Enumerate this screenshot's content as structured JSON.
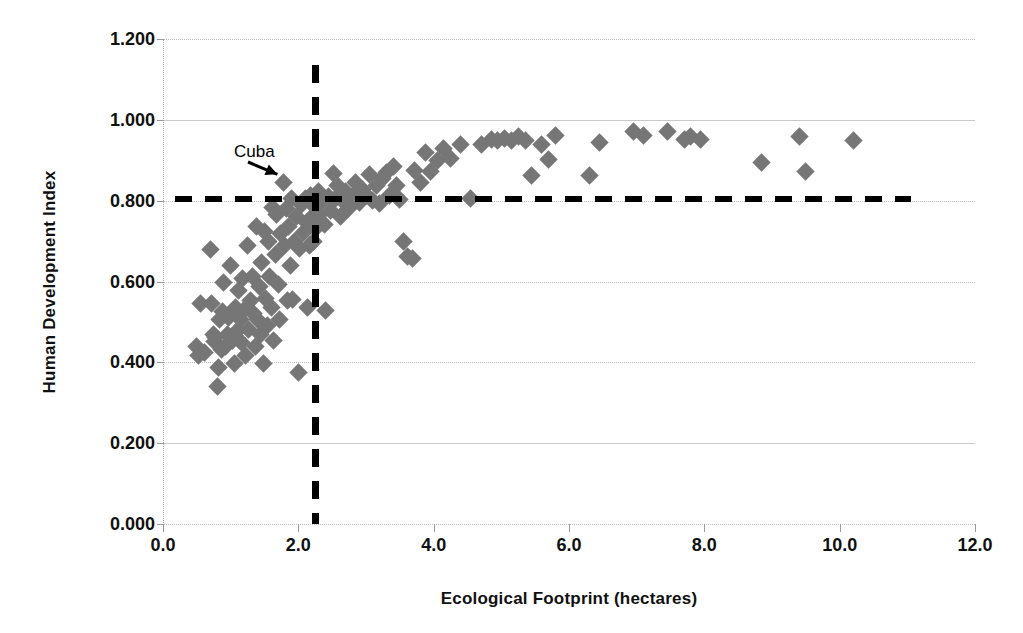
{
  "chart_data": {
    "type": "scatter",
    "title": "",
    "xlabel": "Ecological Footprint (hectares)",
    "ylabel": "Human Development Index",
    "xlim": [
      0.0,
      12.0
    ],
    "ylim": [
      0.0,
      1.2
    ],
    "xticks": [
      "0.0",
      "2.0",
      "4.0",
      "6.0",
      "8.0",
      "10.0",
      "12.0"
    ],
    "xtick_values": [
      0.0,
      2.0,
      4.0,
      6.0,
      8.0,
      10.0,
      12.0
    ],
    "yticks": [
      "0.000",
      "0.200",
      "0.400",
      "0.600",
      "0.800",
      "1.000",
      "1.200"
    ],
    "ytick_values": [
      0.0,
      0.2,
      0.4,
      0.6,
      0.8,
      1.0,
      1.2
    ],
    "grid": true,
    "legend": "none",
    "marker": "diamond",
    "marker_color": "#767676",
    "annotations": [
      {
        "text": "Cuba",
        "label_x": 1.05,
        "label_y": 0.92,
        "target_x": 1.78,
        "target_y": 0.845
      }
    ],
    "threshold_lines": [
      {
        "name": "hdi-threshold",
        "orientation": "horizontal",
        "value": 0.805,
        "x_start": 0.17,
        "x_end": 11.05,
        "color": "#000000",
        "style": "dashed"
      },
      {
        "name": "footprint-threshold",
        "orientation": "vertical",
        "value": 2.26,
        "y_start": 0.0,
        "y_end": 1.135,
        "color": "#000000",
        "style": "dashed"
      }
    ],
    "points": [
      [
        0.49,
        0.438
      ],
      [
        0.52,
        0.418
      ],
      [
        0.55,
        0.545
      ],
      [
        0.62,
        0.425
      ],
      [
        0.7,
        0.678
      ],
      [
        0.72,
        0.545
      ],
      [
        0.74,
        0.47
      ],
      [
        0.76,
        0.452
      ],
      [
        0.78,
        0.462
      ],
      [
        0.8,
        0.34
      ],
      [
        0.82,
        0.388
      ],
      [
        0.84,
        0.505
      ],
      [
        0.86,
        0.432
      ],
      [
        0.88,
        0.525
      ],
      [
        0.9,
        0.598
      ],
      [
        0.93,
        0.44
      ],
      [
        0.95,
        0.468
      ],
      [
        0.97,
        0.512
      ],
      [
        1.0,
        0.64
      ],
      [
        1.02,
        0.455
      ],
      [
        1.05,
        0.398
      ],
      [
        1.07,
        0.535
      ],
      [
        1.1,
        0.478
      ],
      [
        1.12,
        0.578
      ],
      [
        1.14,
        0.505
      ],
      [
        1.16,
        0.448
      ],
      [
        1.18,
        0.608
      ],
      [
        1.2,
        0.53
      ],
      [
        1.22,
        0.418
      ],
      [
        1.25,
        0.69
      ],
      [
        1.27,
        0.482
      ],
      [
        1.3,
        0.552
      ],
      [
        1.32,
        0.612
      ],
      [
        1.34,
        0.52
      ],
      [
        1.36,
        0.438
      ],
      [
        1.38,
        0.735
      ],
      [
        1.4,
        0.505
      ],
      [
        1.42,
        0.588
      ],
      [
        1.44,
        0.47
      ],
      [
        1.46,
        0.648
      ],
      [
        1.48,
        0.398
      ],
      [
        1.5,
        0.723
      ],
      [
        1.52,
        0.558
      ],
      [
        1.54,
        0.492
      ],
      [
        1.56,
        0.7
      ],
      [
        1.58,
        0.612
      ],
      [
        1.6,
        0.535
      ],
      [
        1.62,
        0.782
      ],
      [
        1.64,
        0.455
      ],
      [
        1.66,
        0.668
      ],
      [
        1.68,
        0.765
      ],
      [
        1.7,
        0.592
      ],
      [
        1.72,
        0.505
      ],
      [
        1.74,
        0.718
      ],
      [
        1.78,
        0.845
      ],
      [
        1.8,
        0.69
      ],
      [
        1.82,
        0.78
      ],
      [
        1.84,
        0.552
      ],
      [
        1.86,
        0.735
      ],
      [
        1.88,
        0.64
      ],
      [
        1.9,
        0.805
      ],
      [
        1.92,
        0.555
      ],
      [
        1.95,
        0.7
      ],
      [
        1.98,
        0.76
      ],
      [
        2.0,
        0.375
      ],
      [
        2.02,
        0.682
      ],
      [
        2.05,
        0.79
      ],
      [
        2.08,
        0.722
      ],
      [
        2.1,
        0.805
      ],
      [
        2.12,
        0.745
      ],
      [
        2.14,
        0.535
      ],
      [
        2.16,
        0.69
      ],
      [
        2.18,
        0.812
      ],
      [
        2.2,
        0.758
      ],
      [
        2.22,
        0.7
      ],
      [
        2.24,
        0.785
      ],
      [
        2.26,
        0.73
      ],
      [
        2.3,
        0.822
      ],
      [
        2.32,
        0.765
      ],
      [
        2.35,
        0.8
      ],
      [
        2.38,
        0.742
      ],
      [
        2.4,
        0.528
      ],
      [
        2.45,
        0.81
      ],
      [
        2.48,
        0.775
      ],
      [
        2.52,
        0.868
      ],
      [
        2.55,
        0.805
      ],
      [
        2.58,
        0.838
      ],
      [
        2.62,
        0.762
      ],
      [
        2.66,
        0.8
      ],
      [
        2.7,
        0.822
      ],
      [
        2.74,
        0.78
      ],
      [
        2.8,
        0.81
      ],
      [
        2.85,
        0.845
      ],
      [
        2.9,
        0.795
      ],
      [
        2.95,
        0.828
      ],
      [
        3.0,
        0.812
      ],
      [
        3.05,
        0.865
      ],
      [
        3.1,
        0.8
      ],
      [
        3.15,
        0.838
      ],
      [
        3.2,
        0.792
      ],
      [
        3.25,
        0.855
      ],
      [
        3.3,
        0.87
      ],
      [
        3.35,
        0.812
      ],
      [
        3.4,
        0.885
      ],
      [
        3.45,
        0.838
      ],
      [
        3.5,
        0.802
      ],
      [
        3.55,
        0.7
      ],
      [
        3.62,
        0.662
      ],
      [
        3.68,
        0.658
      ],
      [
        3.72,
        0.875
      ],
      [
        3.8,
        0.845
      ],
      [
        3.88,
        0.92
      ],
      [
        3.95,
        0.872
      ],
      [
        4.05,
        0.9
      ],
      [
        4.15,
        0.93
      ],
      [
        4.25,
        0.905
      ],
      [
        4.4,
        0.94
      ],
      [
        4.55,
        0.805
      ],
      [
        4.7,
        0.938
      ],
      [
        4.85,
        0.952
      ],
      [
        4.95,
        0.948
      ],
      [
        5.05,
        0.955
      ],
      [
        5.15,
        0.95
      ],
      [
        5.25,
        0.958
      ],
      [
        5.35,
        0.948
      ],
      [
        5.45,
        0.862
      ],
      [
        5.6,
        0.94
      ],
      [
        5.7,
        0.902
      ],
      [
        5.8,
        0.962
      ],
      [
        6.3,
        0.862
      ],
      [
        6.45,
        0.945
      ],
      [
        6.95,
        0.972
      ],
      [
        7.1,
        0.962
      ],
      [
        7.45,
        0.97
      ],
      [
        7.7,
        0.952
      ],
      [
        7.8,
        0.958
      ],
      [
        7.95,
        0.952
      ],
      [
        8.85,
        0.895
      ],
      [
        9.4,
        0.958
      ],
      [
        9.5,
        0.872
      ],
      [
        10.2,
        0.948
      ]
    ]
  }
}
